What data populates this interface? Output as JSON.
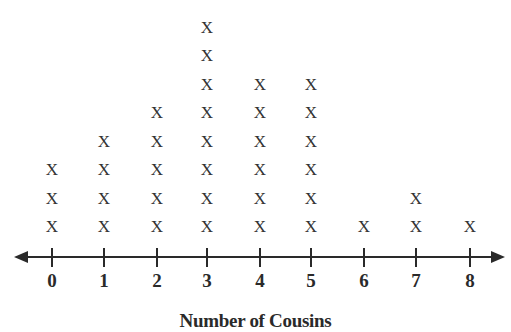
{
  "chart_data": {
    "type": "dot",
    "title": "",
    "xlabel": "Number of Cousins",
    "ylabel": "",
    "marker": "X",
    "categories": [
      "0",
      "1",
      "2",
      "3",
      "4",
      "5",
      "6",
      "7",
      "8"
    ],
    "values": [
      3,
      4,
      5,
      8,
      6,
      6,
      1,
      2,
      1
    ],
    "xlim": [
      0,
      8
    ],
    "grid": false,
    "legend": null
  },
  "axis": {
    "tick_labels": [
      "0",
      "1",
      "2",
      "3",
      "4",
      "5",
      "6",
      "7",
      "8"
    ],
    "label": "Number of Cousins"
  },
  "colors": {
    "ink": "#2a2a2a",
    "background": "#ffffff"
  }
}
